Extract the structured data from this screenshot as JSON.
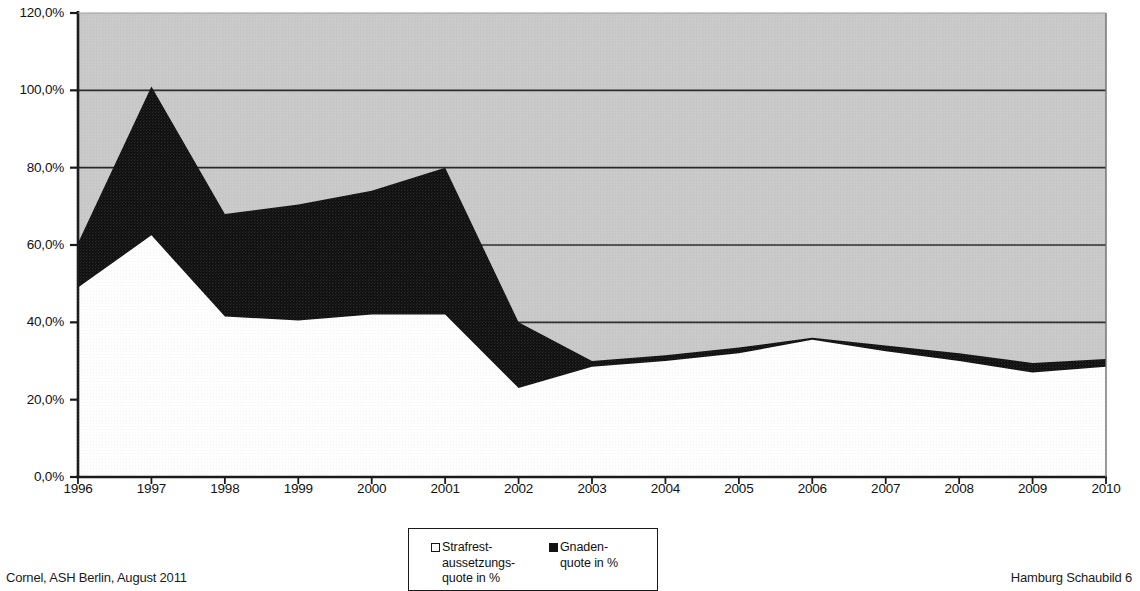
{
  "footer": {
    "left": "Cornel, ASH Berlin, August 2011",
    "right": "Hamburg Schaubild 6"
  },
  "legend": {
    "entries": [
      {
        "label": "Strafrest-\naussetzungs-\nquote in %",
        "swatch": "hollow",
        "color": "#ffffff"
      },
      {
        "label": "Gnaden-\nquote in %",
        "swatch": "filled",
        "color": "#121212"
      }
    ]
  },
  "colors": {
    "plot_background": "#c9c9c9",
    "series_strafrest": "#ffffff",
    "series_gnaden": "#121212",
    "axis": "#1a1a1a",
    "gridline": "#2a2a2a"
  },
  "chart_data": {
    "type": "area",
    "stacked": true,
    "title": "",
    "xlabel": "",
    "ylabel": "",
    "grid": true,
    "legend_position": "bottom-center",
    "ylim": [
      0,
      120
    ],
    "ytick_labels": [
      "0,0%",
      "20,0%",
      "40,0%",
      "60,0%",
      "80,0%",
      "100,0%",
      "120,0%"
    ],
    "ytick_values": [
      0,
      20,
      40,
      60,
      80,
      100,
      120
    ],
    "categories": [
      "1996",
      "1997",
      "1998",
      "1999",
      "2000",
      "2001",
      "2002",
      "2003",
      "2004",
      "2005",
      "2006",
      "2007",
      "2008",
      "2009",
      "2010"
    ],
    "series": [
      {
        "name": "Strafrest-aussetzungs-quote in %",
        "color": "#ffffff",
        "values": [
          49.0,
          62.5,
          41.5,
          40.5,
          42.0,
          42.0,
          23.0,
          28.5,
          30.0,
          32.0,
          35.5,
          32.5,
          30.0,
          27.0,
          28.5
        ]
      },
      {
        "name": "Gnaden-quote in %",
        "color": "#121212",
        "values": [
          11.5,
          38.5,
          26.5,
          30.0,
          32.0,
          38.0,
          17.0,
          1.5,
          1.5,
          1.5,
          0.5,
          1.5,
          2.0,
          2.5,
          2.0
        ]
      }
    ],
    "cumulative_top": [
      60.5,
      101.0,
      68.0,
      70.5,
      74.0,
      80.0,
      40.0,
      30.0,
      31.5,
      33.5,
      36.0,
      34.0,
      32.0,
      29.5,
      30.5
    ]
  }
}
